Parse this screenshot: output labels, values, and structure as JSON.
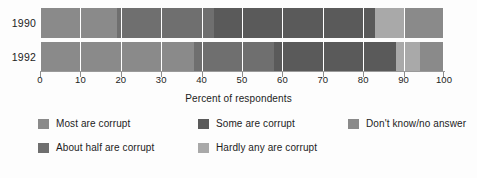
{
  "chart_data": {
    "type": "bar",
    "orientation": "horizontal",
    "stacked": true,
    "title": "",
    "xlabel": "Percent of respondents",
    "ylabel": "",
    "xlim": [
      0,
      100
    ],
    "grid": true,
    "legend_position": "bottom",
    "categories": [
      "1990",
      "1992"
    ],
    "tick_labels": [
      "0",
      "10",
      "20",
      "30",
      "40",
      "50",
      "60",
      "70",
      "80",
      "90",
      "100"
    ],
    "tick_values": [
      0,
      10,
      20,
      30,
      40,
      50,
      60,
      70,
      80,
      90,
      100
    ],
    "series": [
      {
        "name": "Most are corrupt",
        "color": "#8a8a8a",
        "values": [
          19,
          38
        ]
      },
      {
        "name": "About half are corrupt",
        "color": "#6f6f6f",
        "values": [
          24,
          20
        ]
      },
      {
        "name": "Some are corrupt",
        "color": "#5a5a5a",
        "values": [
          40,
          30
        ]
      },
      {
        "name": "Hardly any are corrupt",
        "color": "#a9a9a9",
        "values": [
          7,
          6
        ]
      },
      {
        "name": "Don't know/no answer",
        "color": "#8a8a8a",
        "values": [
          10,
          6
        ]
      }
    ],
    "bars": [
      {
        "category": "1990",
        "segments": [
          {
            "label": "Most are corrupt",
            "start": 0,
            "end": 19,
            "value": 19,
            "color": "#8a8a8a"
          },
          {
            "label": "About half are corrupt",
            "start": 19,
            "end": 43,
            "value": 24,
            "color": "#6f6f6f"
          },
          {
            "label": "Some are corrupt",
            "start": 43,
            "end": 83,
            "value": 40,
            "color": "#5a5a5a"
          },
          {
            "label": "Hardly any are corrupt",
            "start": 83,
            "end": 90,
            "value": 7,
            "color": "#a9a9a9"
          },
          {
            "label": "Don't know/no answer",
            "start": 90,
            "end": 100,
            "value": 10,
            "color": "#8a8a8a"
          }
        ]
      },
      {
        "category": "1992",
        "segments": [
          {
            "label": "Most are corrupt",
            "start": 0,
            "end": 38,
            "value": 38,
            "color": "#8a8a8a"
          },
          {
            "label": "About half are corrupt",
            "start": 38,
            "end": 58,
            "value": 20,
            "color": "#6f6f6f"
          },
          {
            "label": "Some are corrupt",
            "start": 58,
            "end": 88,
            "value": 30,
            "color": "#5a5a5a"
          },
          {
            "label": "Hardly any are corrupt",
            "start": 88,
            "end": 94,
            "value": 6,
            "color": "#a9a9a9"
          },
          {
            "label": "Don't know/no answer",
            "start": 94,
            "end": 100,
            "value": 6,
            "color": "#8a8a8a"
          }
        ]
      }
    ]
  },
  "axis": {
    "title": "Percent of respondents"
  },
  "legend": {
    "items": [
      {
        "label": "Most are corrupt",
        "color": "#8a8a8a"
      },
      {
        "label": "Some are corrupt",
        "color": "#5a5a5a"
      },
      {
        "label": "Don't know/no answer",
        "color": "#8a8a8a"
      },
      {
        "label": "About half are corrupt",
        "color": "#6f6f6f"
      },
      {
        "label": "Hardly any are corrupt",
        "color": "#a9a9a9"
      }
    ]
  },
  "rows": [
    {
      "year": "1990"
    },
    {
      "year": "1992"
    }
  ]
}
